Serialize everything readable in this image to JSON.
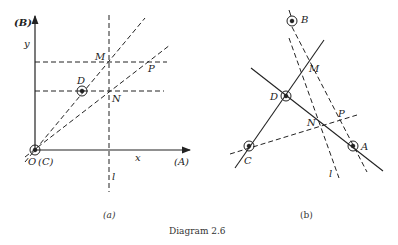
{
  "diagram_a": {
    "caption": "(a)",
    "labels": {
      "B_axis": "(B)",
      "y": "y",
      "M": "M",
      "P": "P",
      "D": "D",
      "N": "N",
      "origin": "O",
      "C_origin": "(C)",
      "x": "x",
      "A_axis": "(A)",
      "l": "l"
    }
  },
  "diagram_b": {
    "caption": "(b)",
    "labels": {
      "B": "B",
      "M": "M",
      "D": "D",
      "P": "P",
      "N": "N",
      "C": "C",
      "A": "A",
      "l": "l"
    }
  },
  "title": "Diagram 2.6"
}
